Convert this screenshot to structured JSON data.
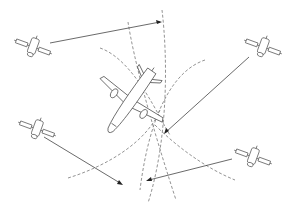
{
  "diagram": {
    "colors": {
      "line": "#444444",
      "arc": "#777777",
      "background": "#ffffff"
    },
    "satellites": [
      {
        "id": "satellite-top-left",
        "x": 33,
        "y": 47
      },
      {
        "id": "satellite-top-right",
        "x": 263,
        "y": 47
      },
      {
        "id": "satellite-bottom-left",
        "x": 37,
        "y": 129
      },
      {
        "id": "satellite-bottom-right",
        "x": 253,
        "y": 157
      }
    ],
    "aircraft": {
      "id": "aircraft",
      "x": 130,
      "y": 100
    }
  }
}
